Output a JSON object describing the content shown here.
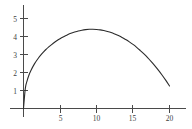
{
  "chart_data": {
    "type": "line",
    "title": "",
    "subtitle": "",
    "xlabel": "",
    "ylabel": "",
    "xlim": [
      0,
      21.5
    ],
    "ylim": [
      0,
      5.6
    ],
    "grid": false,
    "legend": null,
    "annotations": [],
    "x_ticks": [
      {
        "value": 5,
        "label": "5"
      },
      {
        "value": 10,
        "label": "10"
      },
      {
        "value": 15,
        "label": "15"
      },
      {
        "value": 20,
        "label": "20"
      }
    ],
    "y_ticks": [
      {
        "value": 1,
        "label": "1"
      },
      {
        "value": 2,
        "label": "2"
      },
      {
        "value": 3,
        "label": "3"
      },
      {
        "value": 4,
        "label": "4"
      },
      {
        "value": 5,
        "label": "5"
      }
    ],
    "series": [
      {
        "name": "curve",
        "color": "#2b2b2b",
        "x": [
          0,
          0.25,
          0.5,
          0.75,
          1,
          1.5,
          2,
          2.5,
          3,
          3.5,
          4,
          4.5,
          5,
          5.5,
          6,
          6.5,
          7,
          7.5,
          8,
          8.5,
          9,
          9.5,
          10,
          10.5,
          11,
          11.5,
          12,
          12.5,
          13,
          13.5,
          14,
          14.5,
          15,
          15.5,
          16,
          16.5,
          17,
          17.5,
          18,
          18.5,
          19,
          19.5,
          20
        ],
        "y": [
          0,
          0.52,
          0.73,
          0.88,
          1.01,
          1.22,
          1.4,
          1.55,
          1.69,
          1.81,
          1.93,
          2.04,
          2.14,
          2.24,
          2.33,
          2.42,
          2.5,
          2.58,
          2.66,
          2.73,
          2.8,
          2.87,
          2.94,
          3.0,
          3.07,
          3.13,
          3.19,
          3.25,
          3.3,
          3.36,
          3.41,
          3.47,
          3.52,
          3.57,
          3.62,
          3.67,
          3.72,
          3.77,
          3.82,
          3.86,
          3.91,
          3.95,
          4.0
        ],
        "curve_y": [
          0,
          1.12,
          1.55,
          1.86,
          2.1,
          2.48,
          2.78,
          3.03,
          3.25,
          3.44,
          3.6,
          3.75,
          3.88,
          3.99,
          4.09,
          4.18,
          4.25,
          4.31,
          4.35,
          4.38,
          4.4,
          4.4,
          4.39,
          4.37,
          4.33,
          4.28,
          4.22,
          4.14,
          4.05,
          3.95,
          3.83,
          3.7,
          3.56,
          3.4,
          3.22,
          3.03,
          2.83,
          2.61,
          2.37,
          2.12,
          1.85,
          1.56,
          1.25
        ]
      }
    ],
    "peak": {
      "x": 7.5,
      "y": 4.75
    },
    "x_intercepts": [
      0,
      20
    ],
    "axis_color": "#4a4a4a"
  }
}
